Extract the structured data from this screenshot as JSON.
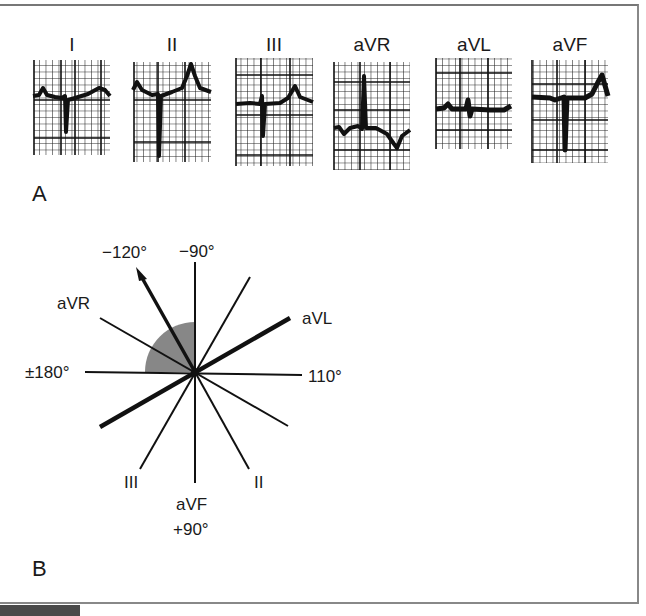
{
  "figure": {
    "panel_a": {
      "label": "A",
      "leads": [
        {
          "name": "I",
          "qrs": "predominantly negative (deep S)",
          "t_wave": "upright"
        },
        {
          "name": "II",
          "qrs": "predominantly negative (deep S)",
          "t_wave": "upright peaked"
        },
        {
          "name": "III",
          "qrs": "negative deflection",
          "t_wave": "upright"
        },
        {
          "name": "aVR",
          "qrs": "positive (tall R)",
          "t_wave": "inverted"
        },
        {
          "name": "aVL",
          "qrs": "isoelectric / small",
          "t_wave": "flat"
        },
        {
          "name": "aVF",
          "qrs": "predominantly negative (deep S)",
          "t_wave": "upright peaked"
        }
      ]
    },
    "panel_b": {
      "label": "B",
      "axis_labels": {
        "top": "−90°",
        "arrow": "−120°",
        "left": "±180°",
        "right": "110°",
        "bottom_lead": "aVF",
        "bottom_angle": "+90°",
        "avr": "aVR",
        "avl": "aVL",
        "lead_iii": "III",
        "lead_ii": "II"
      },
      "mean_axis_deg": -120,
      "shaded_quadrant": "−90° to ±180°",
      "colors": {
        "lines": "#111111",
        "shading": "#7a7a7a"
      }
    }
  }
}
